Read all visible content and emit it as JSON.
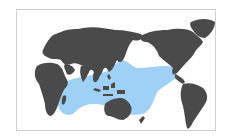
{
  "map": {
    "title": "Species distribution range",
    "projection": "Pacific-centered world map",
    "land_color": "#4a4a4a",
    "ocean_color": "#ffffff",
    "range_color": "#9fd0f5",
    "border_color": "#cfcfcf",
    "range_region": "Indo-Pacific: Indian Ocean, East Africa coast to Central Pacific"
  }
}
